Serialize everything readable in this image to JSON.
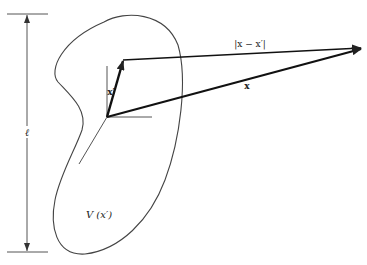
{
  "diagram": {
    "type": "vector-geometry-figure",
    "labels": {
      "height_dimension": "ℓ",
      "source_vector": "x′",
      "difference_vector": "|x − x′|",
      "field_vector": "x",
      "region": "V (x′)"
    },
    "colors": {
      "stroke": "#222222",
      "thin_stroke": "#555555",
      "background": "#ffffff"
    },
    "geometry": {
      "origin": [
        107,
        117
      ],
      "source_point": [
        123,
        60
      ],
      "field_point": [
        362,
        48
      ],
      "dimension_line": {
        "x": 35,
        "top": 14,
        "bottom": 252
      }
    }
  }
}
